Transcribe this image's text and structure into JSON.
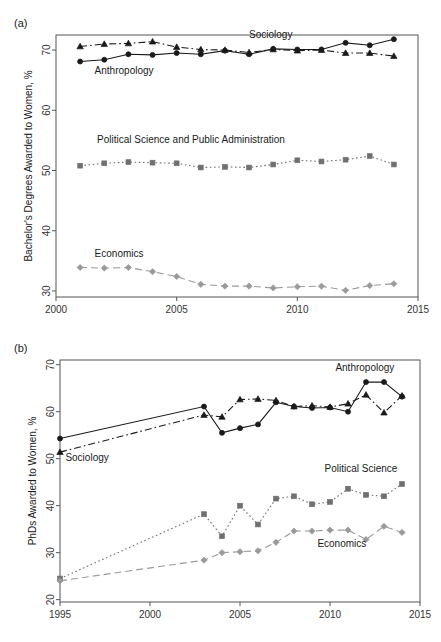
{
  "figure": {
    "background_color": "#ffffff",
    "panels": [
      {
        "tag": "(a)"
      },
      {
        "tag": "(b)"
      }
    ]
  },
  "chart_data": [
    {
      "type": "line",
      "panel": "(a)",
      "title": "",
      "xlabel": "",
      "ylabel": "Bachelor's Degrees Awarded to Women, %",
      "xlim": [
        2000,
        2015
      ],
      "ylim": [
        29,
        72.5
      ],
      "xticks": [
        2000,
        2005,
        2010,
        2015
      ],
      "yticks": [
        30,
        40,
        50,
        60,
        70
      ],
      "xtick_labels": [
        "2000",
        "2005",
        "2010",
        "2015"
      ],
      "ytick_labels": [
        "30",
        "40",
        "50",
        "60",
        "70"
      ],
      "grid": false,
      "legend": "inline-annotations",
      "x": [
        2001,
        2002,
        2003,
        2004,
        2005,
        2006,
        2007,
        2008,
        2009,
        2010,
        2011,
        2012,
        2013,
        2014
      ],
      "series": [
        {
          "name": "Sociology",
          "marker": "circle",
          "linestyle": "solid",
          "color": "#1a1a1a",
          "label_x": 2008.0,
          "label_y": 72.0,
          "values": [
            68.1,
            68.4,
            69.3,
            69.2,
            69.5,
            69.3,
            69.9,
            69.3,
            70.2,
            70.1,
            70.1,
            71.2,
            70.8,
            71.8
          ]
        },
        {
          "name": "Anthropology",
          "marker": "triangle",
          "linestyle": "dashdot",
          "color": "#1a1a1a",
          "label_x": 2001.6,
          "label_y": 66.1,
          "values": [
            70.6,
            71.0,
            71.1,
            71.4,
            70.5,
            70.1,
            70.0,
            69.6,
            70.1,
            69.9,
            70.0,
            69.5,
            69.5,
            69.0
          ]
        },
        {
          "name": "Political Science and Public Administration",
          "marker": "square",
          "linestyle": "dotted",
          "color": "#707070",
          "label_x": 2001.7,
          "label_y": 54.5,
          "values": [
            50.8,
            51.2,
            51.4,
            51.3,
            51.2,
            50.5,
            50.6,
            50.5,
            51.0,
            51.7,
            51.5,
            51.8,
            52.4,
            51.0
          ]
        },
        {
          "name": "Economics",
          "marker": "diamond",
          "linestyle": "dashed",
          "color": "#9a9a9a",
          "label_x": 2001.6,
          "label_y": 35.6,
          "values": [
            33.9,
            33.8,
            33.9,
            33.2,
            32.4,
            31.1,
            30.8,
            30.8,
            30.5,
            30.7,
            30.8,
            30.1,
            30.9,
            31.2
          ]
        }
      ]
    },
    {
      "type": "line",
      "panel": "(b)",
      "title": "",
      "xlabel": "",
      "ylabel": "PhDs Awarded to Women, %",
      "xlim": [
        1995,
        2015
      ],
      "ylim": [
        19.5,
        71
      ],
      "xticks": [
        1995,
        2000,
        2005,
        2010,
        2015
      ],
      "yticks": [
        20,
        30,
        40,
        50,
        60,
        70
      ],
      "xtick_labels": [
        "1995",
        "2000",
        "2005",
        "2010",
        "2015"
      ],
      "ytick_labels": [
        "20",
        "30",
        "40",
        "50",
        "60",
        "70"
      ],
      "grid": false,
      "legend": "inline-annotations",
      "series": [
        {
          "name": "Sociology",
          "marker": "circle",
          "linestyle": "solid",
          "color": "#1a1a1a",
          "label_x": 1995.3,
          "label_y": 49.6,
          "x": [
            1995,
            2003,
            2004,
            2005,
            2006,
            2007,
            2008,
            2009,
            2010,
            2011,
            2012,
            2013,
            2014
          ],
          "values": [
            54.3,
            61.1,
            55.5,
            56.5,
            57.3,
            62.0,
            61.1,
            60.8,
            60.9,
            60.0,
            66.3,
            66.3,
            63.2
          ]
        },
        {
          "name": "Anthropology",
          "marker": "triangle",
          "linestyle": "dashdot",
          "color": "#1a1a1a",
          "label_x": 2010.3,
          "label_y": 68.6,
          "x": [
            1995,
            2003,
            2004,
            2005,
            2006,
            2007,
            2008,
            2009,
            2010,
            2011,
            2012,
            2013,
            2014
          ],
          "values": [
            51.4,
            59.3,
            58.9,
            62.6,
            62.7,
            62.4,
            61.1,
            61.3,
            61.0,
            61.7,
            63.6,
            59.8,
            63.4
          ]
        },
        {
          "name": "Political Science",
          "marker": "square",
          "linestyle": "dotted",
          "color": "#707070",
          "label_x": 2009.7,
          "label_y": 47.1,
          "x": [
            1995,
            2003,
            2004,
            2005,
            2006,
            2007,
            2008,
            2009,
            2010,
            2011,
            2012,
            2013,
            2014
          ],
          "values": [
            24.5,
            38.2,
            33.5,
            40.0,
            36.0,
            41.5,
            42.0,
            40.3,
            40.8,
            43.6,
            42.3,
            42.0,
            44.6
          ]
        },
        {
          "name": "Economics",
          "marker": "diamond",
          "linestyle": "dashed",
          "color": "#9a9a9a",
          "label_x": 2009.3,
          "label_y": 31.3,
          "x": [
            1995,
            2003,
            2004,
            2005,
            2006,
            2007,
            2008,
            2009,
            2010,
            2011,
            2012,
            2013,
            2014
          ],
          "values": [
            24.0,
            28.4,
            30.0,
            30.2,
            30.4,
            32.2,
            34.6,
            34.6,
            34.8,
            34.8,
            32.8,
            35.6,
            34.3
          ]
        }
      ]
    }
  ]
}
